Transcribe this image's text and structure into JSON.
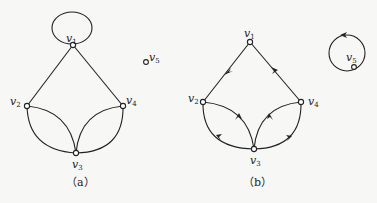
{
  "figure_a": {
    "caption": "（a）",
    "type": "undirected graph",
    "vertices": [
      {
        "id": "v1",
        "label": "v",
        "sub": "1"
      },
      {
        "id": "v2",
        "label": "v",
        "sub": "2"
      },
      {
        "id": "v3",
        "label": "v",
        "sub": "3"
      },
      {
        "id": "v4",
        "label": "v",
        "sub": "4"
      },
      {
        "id": "v5",
        "label": "v",
        "sub": "5"
      }
    ],
    "edges": [
      [
        "v1",
        "v1"
      ],
      [
        "v1",
        "v2"
      ],
      [
        "v1",
        "v4"
      ],
      [
        "v2",
        "v3"
      ],
      [
        "v2",
        "v3"
      ],
      [
        "v3",
        "v4"
      ],
      [
        "v3",
        "v4"
      ]
    ]
  },
  "figure_b": {
    "caption": "（b）",
    "type": "directed graph",
    "vertices": [
      {
        "id": "v1",
        "label": "v",
        "sub": "1"
      },
      {
        "id": "v2",
        "label": "v",
        "sub": "2"
      },
      {
        "id": "v3",
        "label": "v",
        "sub": "3"
      },
      {
        "id": "v4",
        "label": "v",
        "sub": "4"
      },
      {
        "id": "v5",
        "label": "v",
        "sub": "5"
      }
    ],
    "edges": [
      [
        "v1",
        "v2"
      ],
      [
        "v4",
        "v1"
      ],
      [
        "v3",
        "v2"
      ],
      [
        "v3",
        "v2"
      ],
      [
        "v3",
        "v4"
      ],
      [
        "v4",
        "v3"
      ],
      [
        "v5",
        "v5"
      ]
    ]
  }
}
